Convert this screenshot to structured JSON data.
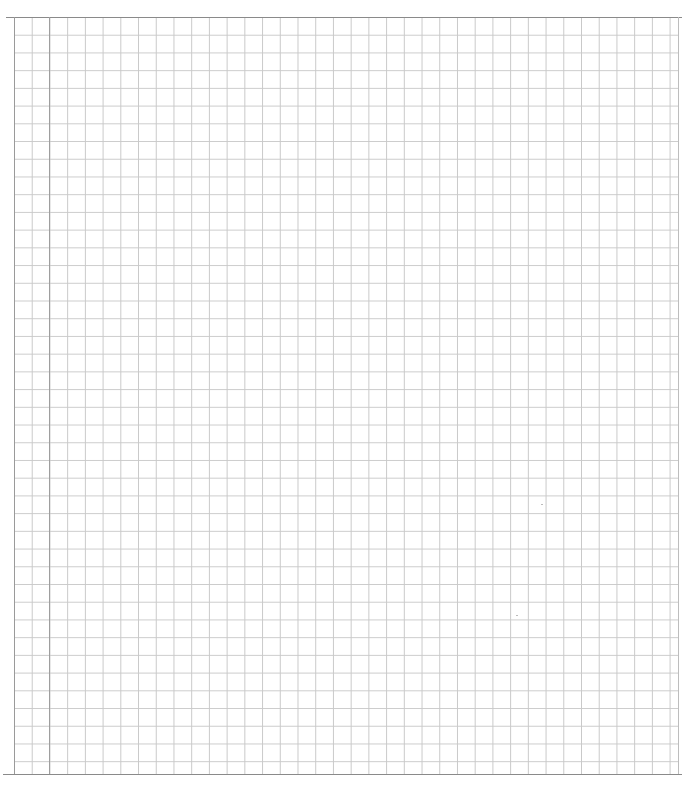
{
  "page": {
    "type": "blank graph paper",
    "width": 683,
    "height": 790
  },
  "grid": {
    "cell_size_px": 17.72,
    "origin": [
      14,
      17
    ],
    "extent": [
      678,
      774
    ],
    "line_color": "#cccccc",
    "border_color": "#8a8a8a",
    "margin_line_x": 49,
    "margin_line_color": "#9e9e9e",
    "background_color": "#ffffff"
  },
  "text": []
}
